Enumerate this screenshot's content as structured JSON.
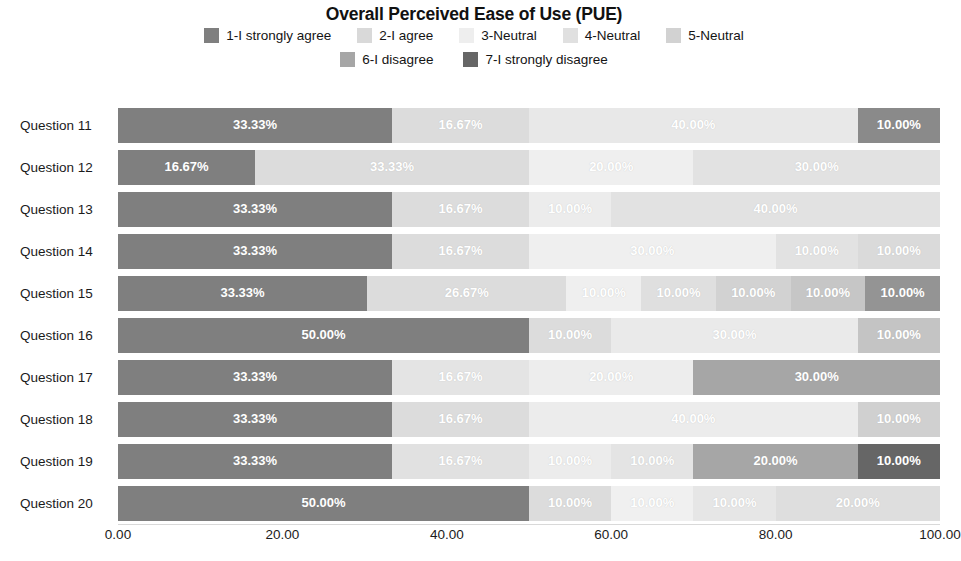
{
  "chart_data": {
    "type": "bar",
    "subtype": "stacked-horizontal-100-percent",
    "title": "Overall Perceived Ease of Use (PUE)",
    "xlabel": "",
    "ylabel": "",
    "xlim": [
      0,
      100
    ],
    "grid": false,
    "legend_position": "top",
    "x_ticks": [
      "0.00",
      "20.00",
      "40.00",
      "60.00",
      "80.00",
      "100.00"
    ],
    "x_tick_values": [
      0,
      20,
      40,
      60,
      80,
      100
    ],
    "categories": [
      "Question 11",
      "Question 12",
      "Question 13",
      "Question 14",
      "Question 15",
      "Question 16",
      "Question 17",
      "Question 18",
      "Question 19",
      "Question 20"
    ],
    "legend": [
      {
        "name": "1-I strongly agree",
        "color": "#7f7f7f"
      },
      {
        "name": "2-I agree",
        "color": "#d9d9d9"
      },
      {
        "name": "3-Neutral",
        "color": "#eeeeee"
      },
      {
        "name": "4-Neutral",
        "color": "#e0e0e0"
      },
      {
        "name": "5-Neutral",
        "color": "#d2d2d2"
      },
      {
        "name": "6-I disagree",
        "color": "#a6a6a6"
      },
      {
        "name": "7-I strongly disagree",
        "color": "#666666"
      }
    ],
    "series": [
      {
        "name": "1-I strongly agree",
        "values": [
          33.33,
          16.67,
          33.33,
          33.33,
          33.33,
          50.0,
          33.33,
          33.33,
          33.33,
          50.0
        ]
      },
      {
        "name": "2-I agree",
        "values": [
          16.67,
          33.33,
          16.67,
          16.67,
          26.67,
          10.0,
          16.67,
          16.67,
          16.67,
          10.0
        ]
      },
      {
        "name": "3-Neutral",
        "values": [
          40.0,
          20.0,
          10.0,
          30.0,
          10.0,
          0.0,
          20.0,
          40.0,
          10.0,
          10.0
        ]
      },
      {
        "name": "4-Neutral",
        "values": [
          0.0,
          30.0,
          40.0,
          10.0,
          10.0,
          30.0,
          0.0,
          0.0,
          10.0,
          10.0
        ]
      },
      {
        "name": "5-Neutral",
        "values": [
          0.0,
          0.0,
          0.0,
          10.0,
          10.0,
          0.0,
          0.0,
          0.0,
          0.0,
          20.0
        ]
      },
      {
        "name": "6-I disagree",
        "values": [
          0.0,
          0.0,
          0.0,
          0.0,
          10.0,
          10.0,
          30.0,
          10.0,
          20.0,
          0.0
        ]
      },
      {
        "name": "7-I strongly disagree",
        "values": [
          10.0,
          0.0,
          0.0,
          0.0,
          10.0,
          0.0,
          0.0,
          0.0,
          10.0,
          0.0
        ]
      }
    ],
    "rows": [
      {
        "label": "Question 11",
        "segments": [
          {
            "series": "1-I strongly agree",
            "value": 33.33,
            "label": "33.33%",
            "color": "#7f7f7f"
          },
          {
            "series": "2-I agree",
            "value": 16.67,
            "label": "16.67%",
            "color": "#dcdcdc"
          },
          {
            "series": "3-Neutral",
            "value": 40.0,
            "label": "40.00%",
            "color": "#e8e8e8"
          },
          {
            "series": "7-I strongly disagree",
            "value": 10.0,
            "label": "10.00%",
            "color": "#8a8a8a"
          }
        ]
      },
      {
        "label": "Question 12",
        "segments": [
          {
            "series": "1-I strongly agree",
            "value": 16.67,
            "label": "16.67%",
            "color": "#7f7f7f"
          },
          {
            "series": "2-I agree",
            "value": 33.33,
            "label": "33.33%",
            "color": "#dcdcdc"
          },
          {
            "series": "3-Neutral",
            "value": 20.0,
            "label": "20.00%",
            "color": "#efefef"
          },
          {
            "series": "4-Neutral",
            "value": 30.0,
            "label": "30.00%",
            "color": "#e2e2e2"
          }
        ]
      },
      {
        "label": "Question 13",
        "segments": [
          {
            "series": "1-I strongly agree",
            "value": 33.33,
            "label": "33.33%",
            "color": "#7f7f7f"
          },
          {
            "series": "2-I agree",
            "value": 16.67,
            "label": "16.67%",
            "color": "#dcdcdc"
          },
          {
            "series": "3-Neutral",
            "value": 10.0,
            "label": "10.00%",
            "color": "#ececec"
          },
          {
            "series": "4-Neutral",
            "value": 40.0,
            "label": "40.00%",
            "color": "#e2e2e2"
          }
        ]
      },
      {
        "label": "Question 14",
        "segments": [
          {
            "series": "1-I strongly agree",
            "value": 33.33,
            "label": "33.33%",
            "color": "#7f7f7f"
          },
          {
            "series": "2-I agree",
            "value": 16.67,
            "label": "16.67%",
            "color": "#dcdcdc"
          },
          {
            "series": "3-Neutral",
            "value": 30.0,
            "label": "30.00%",
            "color": "#efefef"
          },
          {
            "series": "4-Neutral",
            "value": 10.0,
            "label": "10.00%",
            "color": "#e2e2e2"
          },
          {
            "series": "5-Neutral",
            "value": 10.0,
            "label": "10.00%",
            "color": "#dadada"
          }
        ]
      },
      {
        "label": "Question 15",
        "segments": [
          {
            "series": "1-I strongly agree",
            "value": 33.33,
            "label": "33.33%",
            "color": "#7f7f7f"
          },
          {
            "series": "2-I agree",
            "value": 26.67,
            "label": "26.67%",
            "color": "#dcdcdc"
          },
          {
            "series": "3-Neutral",
            "value": 10.0,
            "label": "10.00%",
            "color": "#efefef"
          },
          {
            "series": "4-Neutral",
            "value": 10.0,
            "label": "10.00%",
            "color": "#dfdfdf"
          },
          {
            "series": "5-Neutral",
            "value": 10.0,
            "label": "10.00%",
            "color": "#d2d2d2"
          },
          {
            "series": "6-I disagree",
            "value": 10.0,
            "label": "10.00%",
            "color": "#c6c6c6"
          },
          {
            "series": "7-I strongly disagree",
            "value": 10.0,
            "label": "10.00%",
            "color": "#949494"
          }
        ]
      },
      {
        "label": "Question 16",
        "segments": [
          {
            "series": "1-I strongly agree",
            "value": 50.0,
            "label": "50.00%",
            "color": "#7f7f7f"
          },
          {
            "series": "2-I agree",
            "value": 10.0,
            "label": "10.00%",
            "color": "#dcdcdc"
          },
          {
            "series": "4-Neutral",
            "value": 30.0,
            "label": "30.00%",
            "color": "#eaeaea"
          },
          {
            "series": "6-I disagree",
            "value": 10.0,
            "label": "10.00%",
            "color": "#c4c4c4"
          }
        ]
      },
      {
        "label": "Question 17",
        "segments": [
          {
            "series": "1-I strongly agree",
            "value": 33.33,
            "label": "33.33%",
            "color": "#7f7f7f"
          },
          {
            "series": "2-I agree",
            "value": 16.67,
            "label": "16.67%",
            "color": "#e4e4e4"
          },
          {
            "series": "3-Neutral",
            "value": 20.0,
            "label": "20.00%",
            "color": "#ededed"
          },
          {
            "series": "6-I disagree",
            "value": 30.0,
            "label": "30.00%",
            "color": "#a6a6a6"
          }
        ]
      },
      {
        "label": "Question 18",
        "segments": [
          {
            "series": "1-I strongly agree",
            "value": 33.33,
            "label": "33.33%",
            "color": "#7f7f7f"
          },
          {
            "series": "2-I agree",
            "value": 16.67,
            "label": "16.67%",
            "color": "#dcdcdc"
          },
          {
            "series": "3-Neutral",
            "value": 40.0,
            "label": "40.00%",
            "color": "#ececec"
          },
          {
            "series": "6-I disagree",
            "value": 10.0,
            "label": "10.00%",
            "color": "#d0d0d0"
          }
        ]
      },
      {
        "label": "Question 19",
        "segments": [
          {
            "series": "1-I strongly agree",
            "value": 33.33,
            "label": "33.33%",
            "color": "#7f7f7f"
          },
          {
            "series": "2-I agree",
            "value": 16.67,
            "label": "16.67%",
            "color": "#e1e1e1"
          },
          {
            "series": "3-Neutral",
            "value": 10.0,
            "label": "10.00%",
            "color": "#ececec"
          },
          {
            "series": "4-Neutral",
            "value": 10.0,
            "label": "10.00%",
            "color": "#e4e4e4"
          },
          {
            "series": "6-I disagree",
            "value": 20.0,
            "label": "20.00%",
            "color": "#a6a6a6"
          },
          {
            "series": "7-I strongly disagree",
            "value": 10.0,
            "label": "10.00%",
            "color": "#666666"
          }
        ]
      },
      {
        "label": "Question 20",
        "segments": [
          {
            "series": "1-I strongly agree",
            "value": 50.0,
            "label": "50.00%",
            "color": "#7f7f7f"
          },
          {
            "series": "2-I agree",
            "value": 10.0,
            "label": "10.00%",
            "color": "#dcdcdc"
          },
          {
            "series": "3-Neutral",
            "value": 10.0,
            "label": "10.00%",
            "color": "#f0f0f0"
          },
          {
            "series": "4-Neutral",
            "value": 10.0,
            "label": "10.00%",
            "color": "#e6e6e6"
          },
          {
            "series": "5-Neutral",
            "value": 20.0,
            "label": "20.00%",
            "color": "#dedede"
          }
        ]
      }
    ]
  },
  "colors": {
    "background": "#ffffff",
    "title_text": "#111111",
    "axis_text": "#1b1b1b",
    "bar_label_text": "#ffffff",
    "axis_line": "#d9d9d9"
  }
}
